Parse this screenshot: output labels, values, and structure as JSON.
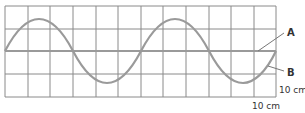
{
  "diagram": {
    "type": "wave-comparison-grid",
    "grid": {
      "columns": 12,
      "rows": 4,
      "color": "#8a8a8a"
    },
    "labels": {
      "a": "A",
      "b": "B",
      "vertical_scale": "10 cm",
      "horizontal_scale": "10 cm"
    },
    "line_a": {
      "description": "undisturbed rope / equilibrium line",
      "color": "#999999"
    },
    "wave_b": {
      "description": "transverse wave, 2 full wavelengths across 12 squares",
      "wavelength_squares": 6,
      "amplitude_squares": 1.4,
      "color": "#999999"
    }
  }
}
